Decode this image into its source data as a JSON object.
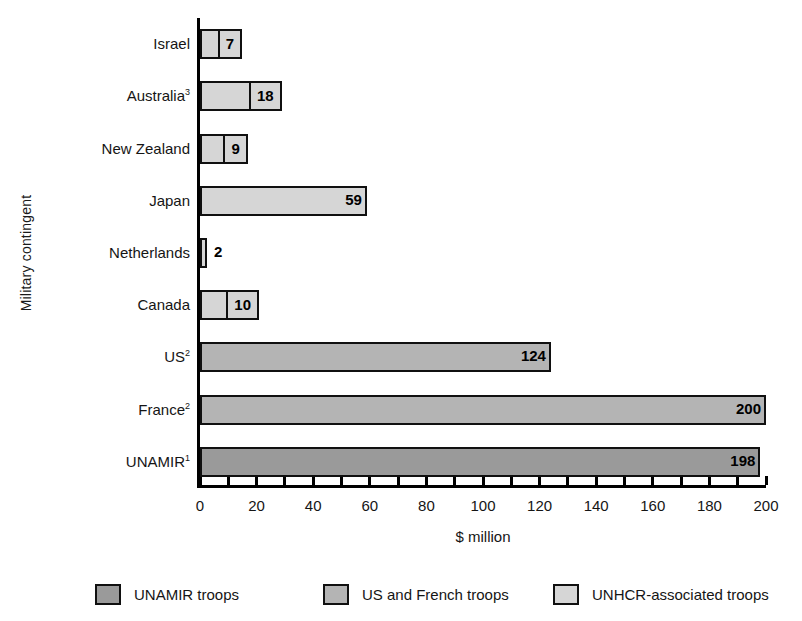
{
  "chart_data": {
    "type": "bar",
    "orientation": "horizontal",
    "title": "",
    "xlabel": "$ million",
    "ylabel": "Military contingent",
    "xlim": [
      0,
      200
    ],
    "grid": false,
    "xticks": [
      0,
      20,
      40,
      60,
      80,
      100,
      120,
      140,
      160,
      180,
      200
    ],
    "xtick_labels": [
      "0",
      "20",
      "40",
      "60",
      "80",
      "100",
      "120",
      "140",
      "160",
      "180",
      "200"
    ],
    "minor_tick_step": 10,
    "categories": [
      "Israel",
      "Australia",
      "New Zealand",
      "Japan",
      "Netherlands",
      "Canada",
      "US",
      "France",
      "UNAMIR"
    ],
    "values": [
      7,
      18,
      9,
      59,
      2,
      10,
      124,
      200,
      198
    ],
    "legend_position": "bottom",
    "series": [
      {
        "name": "UNAMIR troops",
        "color": "#9a9a9a"
      },
      {
        "name": "US and French troops",
        "color": "#b4b4b4"
      },
      {
        "name": "UNHCR-associated troops",
        "color": "#d6d6d6"
      }
    ],
    "bars": [
      {
        "category": "Israel",
        "label_html": "Israel",
        "footnote": "",
        "value": 7,
        "value_label": "7",
        "series": "unhcr",
        "label_placement": "box"
      },
      {
        "category": "Australia",
        "label_html": "Australia",
        "footnote": "3",
        "value": 18,
        "value_label": "18",
        "series": "unhcr",
        "label_placement": "box"
      },
      {
        "category": "New Zealand",
        "label_html": "New Zealand",
        "footnote": "",
        "value": 9,
        "value_label": "9",
        "series": "unhcr",
        "label_placement": "box"
      },
      {
        "category": "Japan",
        "label_html": "Japan",
        "footnote": "",
        "value": 59,
        "value_label": "59",
        "series": "unhcr",
        "label_placement": "inside"
      },
      {
        "category": "Netherlands",
        "label_html": "Netherlands",
        "footnote": "",
        "value": 2,
        "value_label": "2",
        "series": "unhcr",
        "label_placement": "outside"
      },
      {
        "category": "Canada",
        "label_html": "Canada",
        "footnote": "",
        "value": 10,
        "value_label": "10",
        "series": "unhcr",
        "label_placement": "box"
      },
      {
        "category": "US",
        "label_html": "US",
        "footnote": "2",
        "value": 124,
        "value_label": "124",
        "series": "usfrench",
        "label_placement": "inside"
      },
      {
        "category": "France",
        "label_html": "France",
        "footnote": "2",
        "value": 200,
        "value_label": "200",
        "series": "usfrench",
        "label_placement": "inside"
      },
      {
        "category": "UNAMIR",
        "label_html": "UNAMIR",
        "footnote": "1",
        "value": 198,
        "value_label": "198",
        "series": "unamir",
        "label_placement": "inside"
      }
    ]
  },
  "axis": {
    "y_title": "Military contingent",
    "x_title": "$ million"
  },
  "category_labels": [
    {
      "text": "Israel",
      "footnote": ""
    },
    {
      "text": "Australia",
      "footnote": "3"
    },
    {
      "text": "New Zealand",
      "footnote": ""
    },
    {
      "text": "Japan",
      "footnote": ""
    },
    {
      "text": "Netherlands",
      "footnote": ""
    },
    {
      "text": "Canada",
      "footnote": ""
    },
    {
      "text": "US",
      "footnote": "2"
    },
    {
      "text": "France",
      "footnote": "2"
    },
    {
      "text": "UNAMIR",
      "footnote": "1"
    }
  ],
  "legend": {
    "items": [
      {
        "label": "UNAMIR troops",
        "series": "unamir",
        "color": "#9a9a9a"
      },
      {
        "label": "US and French troops",
        "series": "usfrench",
        "color": "#b4b4b4"
      },
      {
        "label": "UNHCR-associated troops",
        "series": "unhcr",
        "color": "#d6d6d6"
      }
    ]
  }
}
